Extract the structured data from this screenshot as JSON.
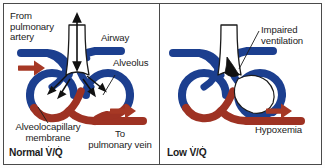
{
  "figure": {
    "frame_color": "#4a4a4a",
    "background": "#ffffff"
  },
  "colors": {
    "vein_blue": "#1c3f8f",
    "artery_red": "#9e3223",
    "arrow_red": "#a63825",
    "airway_white": "#ffffff",
    "outline_black": "#1b1b1b",
    "obstruction_black": "#111111",
    "text": "#1b1b1b"
  },
  "panels": [
    {
      "id": "normal",
      "caption": "Normal V/Q",
      "caption_parts": {
        "word": "Normal",
        "v": "V",
        "slash": "/",
        "q": "Q"
      },
      "labels": [
        {
          "name": "from-pulmonary-artery",
          "text": "From\npulmonary\nartery"
        },
        {
          "name": "airway",
          "text": "Airway"
        },
        {
          "name": "alveolus",
          "text": "Alveolus"
        },
        {
          "name": "alveolocapillary-membrane",
          "text": "Alveolocapillary\nmembrane"
        },
        {
          "name": "to-pulmonary-vein",
          "text": "To\npulmonary vein"
        }
      ],
      "flow_arrows": [
        {
          "name": "inflow-arrow",
          "direction": "right"
        },
        {
          "name": "outflow-arrow",
          "direction": "right"
        }
      ],
      "airway_arrow": {
        "name": "bidirectional-airflow-arrow",
        "direction": "up-down"
      },
      "gas_exchange_arrows": 4,
      "airway_state": "patent"
    },
    {
      "id": "low",
      "caption": "Low V/Q",
      "caption_parts": {
        "word": "Low",
        "v": "V",
        "slash": "/",
        "q": "Q"
      },
      "labels": [
        {
          "name": "impaired-ventilation",
          "text": "Impaired\nventilation"
        },
        {
          "name": "hypoxemia",
          "text": "Hypoxemia"
        }
      ],
      "flow_arrows": [
        {
          "name": "outflow-arrow",
          "direction": "right"
        }
      ],
      "airway_state": "obstructed",
      "alveolus_state": "collapsed"
    }
  ]
}
